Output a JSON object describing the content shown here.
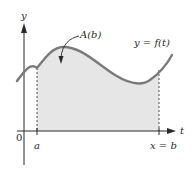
{
  "figure": {
    "axes": {
      "y_label": "y",
      "x_label": "t",
      "origin_label": "0"
    },
    "ticks": {
      "a_label": "a",
      "b_label": "x = b"
    },
    "curve_label": "y = f(t)",
    "area_label": "A(b)",
    "colors": {
      "curve": "#7a7a7a",
      "fill": "#e6e6e6",
      "axis": "#2a2a2a",
      "text": "#2a2a2a"
    }
  }
}
